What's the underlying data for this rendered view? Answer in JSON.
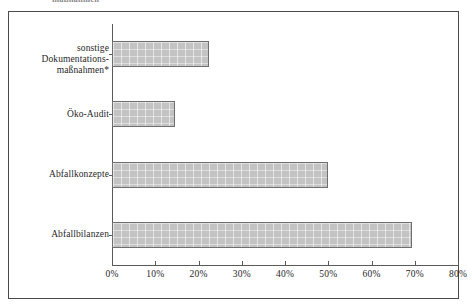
{
  "caption": {
    "text": "maßnahmen",
    "note": "partially cropped caption line at top edge of image"
  },
  "chart_data": {
    "type": "bar",
    "orientation": "horizontal",
    "title": "",
    "subtitle": "",
    "xlabel": "",
    "ylabel": "",
    "categories": [
      "Abfallbilanzen",
      "Abfallkonzepte",
      "Öko-Audit",
      "sonstige Dokumentations-\nmaßnahmen*"
    ],
    "values": [
      69.4,
      50.0,
      14.6,
      22.4
    ],
    "value_labels": [
      "69%",
      "50%",
      "15%",
      "22%"
    ],
    "xlim": [
      0,
      80
    ],
    "xtick_values": [
      0,
      10,
      20,
      30,
      40,
      50,
      60,
      70,
      80
    ],
    "xtick_labels": [
      "0%",
      "10%",
      "20%",
      "30%",
      "40%",
      "50%",
      "60%",
      "70%",
      "80%"
    ],
    "grid": false,
    "legend": false,
    "bar_fill_color": "#c3c3c3",
    "bar_border_color": "#6e6e6e",
    "axis_color": "#5a5a5a",
    "frame_color": "#4a4a4a",
    "text_color": "#1f1f1f"
  }
}
